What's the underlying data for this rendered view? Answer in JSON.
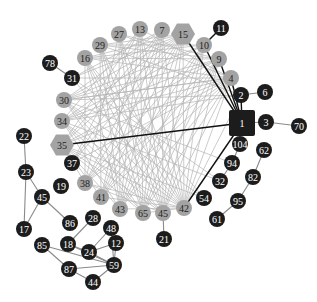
{
  "diagram": {
    "type": "network-graph",
    "colors": {
      "background": "#ffffff",
      "dark_node": "#1c1c1c",
      "light_node": "#a3a3a3",
      "dark_label": "#ffffff",
      "light_label": "#222222",
      "edge_light": "#b5b5b5",
      "edge_dark": "#111111",
      "edge_gray": "#8a8a8a"
    },
    "nodes": [
      {
        "id": "n1",
        "label": "1",
        "x": 242,
        "y": 123,
        "shape": "square",
        "tone": "dark",
        "r": 13
      },
      {
        "id": "n2",
        "label": "2",
        "x": 241,
        "y": 95,
        "shape": "circle",
        "tone": "dark",
        "r": 8
      },
      {
        "id": "n3",
        "label": "3",
        "x": 266,
        "y": 122,
        "shape": "circle",
        "tone": "dark",
        "r": 8
      },
      {
        "id": "n4",
        "label": "4",
        "x": 231,
        "y": 78,
        "shape": "circle",
        "tone": "light",
        "r": 8
      },
      {
        "id": "n6",
        "label": "6",
        "x": 265,
        "y": 92,
        "shape": "circle",
        "tone": "dark",
        "r": 8
      },
      {
        "id": "n7",
        "label": "7",
        "x": 162,
        "y": 30,
        "shape": "circle",
        "tone": "light",
        "r": 8
      },
      {
        "id": "n9",
        "label": "9",
        "x": 219,
        "y": 59,
        "shape": "circle",
        "tone": "light",
        "r": 8
      },
      {
        "id": "n10",
        "label": "10",
        "x": 204,
        "y": 45,
        "shape": "circle",
        "tone": "light",
        "r": 8
      },
      {
        "id": "n11",
        "label": "11",
        "x": 221,
        "y": 28,
        "shape": "circle",
        "tone": "dark",
        "r": 8
      },
      {
        "id": "n12",
        "label": "12",
        "x": 116,
        "y": 243,
        "shape": "circle",
        "tone": "dark",
        "r": 8
      },
      {
        "id": "n13",
        "label": "13",
        "x": 140,
        "y": 29,
        "shape": "circle",
        "tone": "light",
        "r": 8
      },
      {
        "id": "n15",
        "label": "15",
        "x": 183,
        "y": 34,
        "shape": "hexagon",
        "tone": "light",
        "r": 12
      },
      {
        "id": "n16",
        "label": "16",
        "x": 85,
        "y": 58,
        "shape": "circle",
        "tone": "light",
        "r": 8
      },
      {
        "id": "n17",
        "label": "17",
        "x": 24,
        "y": 229,
        "shape": "circle",
        "tone": "dark",
        "r": 8
      },
      {
        "id": "n18",
        "label": "18",
        "x": 68,
        "y": 244,
        "shape": "circle",
        "tone": "dark",
        "r": 8
      },
      {
        "id": "n19",
        "label": "19",
        "x": 61,
        "y": 186,
        "shape": "circle",
        "tone": "dark",
        "r": 8
      },
      {
        "id": "n21",
        "label": "21",
        "x": 164,
        "y": 239,
        "shape": "circle",
        "tone": "dark",
        "r": 8
      },
      {
        "id": "n22",
        "label": "22",
        "x": 24,
        "y": 136,
        "shape": "circle",
        "tone": "dark",
        "r": 8
      },
      {
        "id": "n23",
        "label": "23",
        "x": 26,
        "y": 172,
        "shape": "circle",
        "tone": "dark",
        "r": 8
      },
      {
        "id": "n24",
        "label": "24",
        "x": 89,
        "y": 252,
        "shape": "circle",
        "tone": "dark",
        "r": 8
      },
      {
        "id": "n27",
        "label": "27",
        "x": 119,
        "y": 34,
        "shape": "circle",
        "tone": "light",
        "r": 8
      },
      {
        "id": "n28",
        "label": "28",
        "x": 93,
        "y": 218,
        "shape": "circle",
        "tone": "dark",
        "r": 8
      },
      {
        "id": "n29",
        "label": "29",
        "x": 100,
        "y": 45,
        "shape": "circle",
        "tone": "light",
        "r": 8
      },
      {
        "id": "n30",
        "label": "30",
        "x": 64,
        "y": 100,
        "shape": "circle",
        "tone": "light",
        "r": 8
      },
      {
        "id": "n31",
        "label": "31",
        "x": 72,
        "y": 78,
        "shape": "circle",
        "tone": "dark",
        "r": 8
      },
      {
        "id": "n32",
        "label": "32",
        "x": 220,
        "y": 181,
        "shape": "circle",
        "tone": "dark",
        "r": 8
      },
      {
        "id": "n34",
        "label": "34",
        "x": 62,
        "y": 121,
        "shape": "circle",
        "tone": "light",
        "r": 8
      },
      {
        "id": "n35",
        "label": "35",
        "x": 62,
        "y": 145,
        "shape": "hexagon",
        "tone": "light",
        "r": 12
      },
      {
        "id": "n37",
        "label": "37",
        "x": 72,
        "y": 163,
        "shape": "circle",
        "tone": "dark",
        "r": 8
      },
      {
        "id": "n38",
        "label": "38",
        "x": 85,
        "y": 183,
        "shape": "circle",
        "tone": "light",
        "r": 8
      },
      {
        "id": "n41",
        "label": "41",
        "x": 101,
        "y": 197,
        "shape": "circle",
        "tone": "light",
        "r": 8
      },
      {
        "id": "n42",
        "label": "42",
        "x": 184,
        "y": 208,
        "shape": "circle",
        "tone": "light",
        "r": 8
      },
      {
        "id": "n43",
        "label": "43",
        "x": 120,
        "y": 209,
        "shape": "circle",
        "tone": "light",
        "r": 8
      },
      {
        "id": "n44",
        "label": "44",
        "x": 93,
        "y": 282,
        "shape": "circle",
        "tone": "dark",
        "r": 8
      },
      {
        "id": "n45a",
        "label": "45",
        "x": 42,
        "y": 197,
        "shape": "circle",
        "tone": "dark",
        "r": 8
      },
      {
        "id": "n45b",
        "label": "45",
        "x": 163,
        "y": 213,
        "shape": "circle",
        "tone": "light",
        "r": 8
      },
      {
        "id": "n48",
        "label": "48",
        "x": 111,
        "y": 228,
        "shape": "circle",
        "tone": "dark",
        "r": 8
      },
      {
        "id": "n54",
        "label": "54",
        "x": 204,
        "y": 198,
        "shape": "circle",
        "tone": "dark",
        "r": 8
      },
      {
        "id": "n59",
        "label": "59",
        "x": 114,
        "y": 265,
        "shape": "circle",
        "tone": "dark",
        "r": 8
      },
      {
        "id": "n61",
        "label": "61",
        "x": 217,
        "y": 219,
        "shape": "circle",
        "tone": "dark",
        "r": 8
      },
      {
        "id": "n62",
        "label": "62",
        "x": 264,
        "y": 150,
        "shape": "circle",
        "tone": "dark",
        "r": 8
      },
      {
        "id": "n65",
        "label": "65",
        "x": 143,
        "y": 213,
        "shape": "circle",
        "tone": "light",
        "r": 8
      },
      {
        "id": "n70",
        "label": "70",
        "x": 299,
        "y": 126,
        "shape": "circle",
        "tone": "dark",
        "r": 8
      },
      {
        "id": "n78",
        "label": "78",
        "x": 50,
        "y": 63,
        "shape": "circle",
        "tone": "dark",
        "r": 8
      },
      {
        "id": "n82",
        "label": "82",
        "x": 253,
        "y": 177,
        "shape": "circle",
        "tone": "dark",
        "r": 8
      },
      {
        "id": "n85",
        "label": "85",
        "x": 42,
        "y": 245,
        "shape": "circle",
        "tone": "dark",
        "r": 8
      },
      {
        "id": "n86",
        "label": "86",
        "x": 70,
        "y": 223,
        "shape": "circle",
        "tone": "dark",
        "r": 8
      },
      {
        "id": "n87",
        "label": "87",
        "x": 69,
        "y": 269,
        "shape": "circle",
        "tone": "dark",
        "r": 8
      },
      {
        "id": "n94",
        "label": "94",
        "x": 232,
        "y": 163,
        "shape": "circle",
        "tone": "dark",
        "r": 8
      },
      {
        "id": "n95",
        "label": "95",
        "x": 238,
        "y": 201,
        "shape": "circle",
        "tone": "dark",
        "r": 8
      },
      {
        "id": "n104",
        "label": "104",
        "x": 240,
        "y": 144,
        "shape": "circle",
        "tone": "dark",
        "r": 8
      }
    ],
    "edges_dark": [
      [
        "n1",
        "n35"
      ],
      [
        "n1",
        "n15"
      ],
      [
        "n1",
        "n10"
      ],
      [
        "n1",
        "n9"
      ],
      [
        "n1",
        "n4"
      ],
      [
        "n1",
        "n2"
      ],
      [
        "n1",
        "n42"
      ],
      [
        "n10",
        "n11"
      ]
    ],
    "edges_gray": [
      [
        "n1",
        "n3"
      ],
      [
        "n3",
        "n70"
      ],
      [
        "n2",
        "n6"
      ],
      [
        "n31",
        "n78"
      ],
      [
        "n22",
        "n23"
      ],
      [
        "n23",
        "n17"
      ],
      [
        "n23",
        "n45a"
      ],
      [
        "n45a",
        "n17"
      ],
      [
        "n45a",
        "n86"
      ],
      [
        "n45b",
        "n21"
      ],
      [
        "n104",
        "n94"
      ],
      [
        "n94",
        "n32"
      ],
      [
        "n62",
        "n82"
      ],
      [
        "n82",
        "n95"
      ],
      [
        "n95",
        "n61"
      ],
      [
        "n28",
        "n18"
      ],
      [
        "n48",
        "n24"
      ],
      [
        "n18",
        "n24"
      ],
      [
        "n24",
        "n12"
      ],
      [
        "n24",
        "n59"
      ],
      [
        "n12",
        "n59"
      ],
      [
        "n48",
        "n59"
      ],
      [
        "n85",
        "n87"
      ],
      [
        "n85",
        "n59"
      ],
      [
        "n87",
        "n59"
      ],
      [
        "n87",
        "n44"
      ],
      [
        "n44",
        "n59"
      ],
      [
        "n18",
        "n59"
      ]
    ],
    "edges_light": [
      [
        "n15",
        "n35"
      ],
      [
        "n15",
        "n34"
      ],
      [
        "n15",
        "n30"
      ],
      [
        "n15",
        "n38"
      ],
      [
        "n15",
        "n41"
      ],
      [
        "n15",
        "n43"
      ],
      [
        "n15",
        "n65"
      ],
      [
        "n15",
        "n45b"
      ],
      [
        "n15",
        "n42"
      ],
      [
        "n15",
        "n16"
      ],
      [
        "n15",
        "n29"
      ],
      [
        "n7",
        "n35"
      ],
      [
        "n7",
        "n38"
      ],
      [
        "n7",
        "n41"
      ],
      [
        "n7",
        "n43"
      ],
      [
        "n7",
        "n65"
      ],
      [
        "n7",
        "n45b"
      ],
      [
        "n7",
        "n42"
      ],
      [
        "n7",
        "n30"
      ],
      [
        "n13",
        "n35"
      ],
      [
        "n13",
        "n41"
      ],
      [
        "n13",
        "n43"
      ],
      [
        "n13",
        "n65"
      ],
      [
        "n13",
        "n45b"
      ],
      [
        "n13",
        "n42"
      ],
      [
        "n13",
        "n34"
      ],
      [
        "n13",
        "n4"
      ],
      [
        "n27",
        "n38"
      ],
      [
        "n27",
        "n43"
      ],
      [
        "n27",
        "n65"
      ],
      [
        "n27",
        "n45b"
      ],
      [
        "n27",
        "n42"
      ],
      [
        "n27",
        "n9"
      ],
      [
        "n27",
        "n4"
      ],
      [
        "n29",
        "n41"
      ],
      [
        "n29",
        "n43"
      ],
      [
        "n29",
        "n65"
      ],
      [
        "n29",
        "n45b"
      ],
      [
        "n29",
        "n42"
      ],
      [
        "n29",
        "n10"
      ],
      [
        "n29",
        "n2"
      ],
      [
        "n16",
        "n43"
      ],
      [
        "n16",
        "n65"
      ],
      [
        "n16",
        "n45b"
      ],
      [
        "n16",
        "n42"
      ],
      [
        "n16",
        "n9"
      ],
      [
        "n16",
        "n4"
      ],
      [
        "n16",
        "n38"
      ],
      [
        "n30",
        "n10"
      ],
      [
        "n30",
        "n9"
      ],
      [
        "n30",
        "n4"
      ],
      [
        "n30",
        "n42"
      ],
      [
        "n30",
        "n45b"
      ],
      [
        "n30",
        "n65"
      ],
      [
        "n30",
        "n2"
      ],
      [
        "n34",
        "n10"
      ],
      [
        "n34",
        "n9"
      ],
      [
        "n34",
        "n4"
      ],
      [
        "n34",
        "n42"
      ],
      [
        "n34",
        "n45b"
      ],
      [
        "n34",
        "n65"
      ],
      [
        "n34",
        "n43"
      ],
      [
        "n35",
        "n9"
      ],
      [
        "n35",
        "n4"
      ],
      [
        "n35",
        "n42"
      ],
      [
        "n35",
        "n45b"
      ],
      [
        "n35",
        "n65"
      ],
      [
        "n35",
        "n43"
      ],
      [
        "n35",
        "n41"
      ],
      [
        "n35",
        "n38"
      ],
      [
        "n38",
        "n10"
      ],
      [
        "n38",
        "n4"
      ],
      [
        "n38",
        "n9"
      ],
      [
        "n38",
        "n42"
      ],
      [
        "n38",
        "n45b"
      ],
      [
        "n41",
        "n10"
      ],
      [
        "n41",
        "n4"
      ],
      [
        "n41",
        "n9"
      ],
      [
        "n41",
        "n42"
      ],
      [
        "n43",
        "n10"
      ],
      [
        "n43",
        "n9"
      ],
      [
        "n43",
        "n4"
      ],
      [
        "n43",
        "n42"
      ],
      [
        "n65",
        "n10"
      ],
      [
        "n65",
        "n9"
      ],
      [
        "n65",
        "n4"
      ],
      [
        "n65",
        "n42"
      ],
      [
        "n45b",
        "n10"
      ],
      [
        "n45b",
        "n9"
      ],
      [
        "n45b",
        "n4"
      ],
      [
        "n42",
        "n10"
      ],
      [
        "n42",
        "n9"
      ],
      [
        "n42",
        "n4"
      ],
      [
        "n42",
        "n2"
      ],
      [
        "n37",
        "n15"
      ],
      [
        "n37",
        "n7"
      ],
      [
        "n37",
        "n13"
      ],
      [
        "n37",
        "n4"
      ],
      [
        "n31",
        "n15"
      ],
      [
        "n31",
        "n7"
      ],
      [
        "n31",
        "n42"
      ],
      [
        "n31",
        "n4"
      ],
      [
        "n54",
        "n30"
      ],
      [
        "n54",
        "n35"
      ],
      [
        "n54",
        "n16"
      ],
      [
        "n32",
        "n34"
      ],
      [
        "n32",
        "n31"
      ],
      [
        "n94",
        "n30"
      ],
      [
        "n10",
        "n16"
      ],
      [
        "n9",
        "n29"
      ],
      [
        "n4",
        "n30"
      ],
      [
        "n2",
        "n34"
      ]
    ]
  }
}
